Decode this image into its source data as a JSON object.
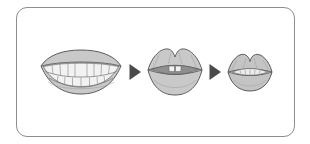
{
  "panel": {
    "name": "mouth-articulation-sequence-panel",
    "border_color": "#8d8d8d",
    "background_color": "#ffffff",
    "corner_radius_px": 11
  },
  "sequence": {
    "direction": "left-to-right",
    "step_count": 3,
    "arrow_count": 2,
    "steps": [
      {
        "id": "step-1",
        "label": "wide-open-smiling-mouth-with-full-teeth",
        "aperture": "wide",
        "teeth_visible": true,
        "upper_teeth_count": 9,
        "lower_teeth_count": 8,
        "width_px": 86,
        "height_px": 48
      },
      {
        "id": "step-2",
        "label": "medium-open-lips-with-two-upper-teeth",
        "aperture": "medium",
        "teeth_visible": true,
        "upper_teeth_count": 2,
        "lower_teeth_count": 0,
        "width_px": 58,
        "height_px": 56
      },
      {
        "id": "step-3",
        "label": "small-pursed-lips-nearly-closed",
        "aperture": "small",
        "teeth_visible": false,
        "upper_teeth_count": 0,
        "lower_teeth_count": 0,
        "width_px": 48,
        "height_px": 44
      }
    ],
    "arrows": [
      {
        "id": "arrow-1",
        "label": "progression-arrow",
        "glyph": "triangle-right"
      },
      {
        "id": "arrow-2",
        "label": "progression-arrow",
        "glyph": "triangle-right"
      }
    ]
  },
  "colors": {
    "lip_fill": "#c9c9c9",
    "lip_outline": "#5b5b5b",
    "tooth_fill": "#f2f2f2",
    "tooth_outline": "#6a6a6a",
    "mouth_interior": "#8f8f8f",
    "arrow": "#4a4a4a",
    "frame": "#8d8d8d"
  }
}
